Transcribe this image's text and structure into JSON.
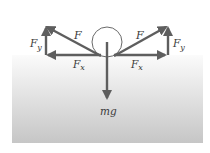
{
  "diagram": {
    "type": "free-body-force-diagram",
    "colors": {
      "arrow": "#5e5e5e",
      "ball_stroke": "#6a6a6a",
      "ground_top": "#fafafa",
      "ground_bottom": "#c4c4c4",
      "text": "#3a3a3a"
    },
    "labels": {
      "left_F": "F",
      "left_Fx": "F",
      "left_Fx_sub": "x",
      "left_Fy": "F",
      "left_Fy_sub": "y",
      "right_F": "F",
      "right_Fx": "F",
      "right_Fx_sub": "x",
      "right_Fy": "F",
      "right_Fy_sub": "y",
      "weight": "mg"
    }
  }
}
